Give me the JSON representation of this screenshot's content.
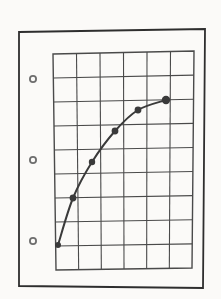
{
  "page": {
    "width": 221,
    "height": 299,
    "background_color": "#f3f2f0",
    "paper_color": "#fbfaf8",
    "ink_color": "#3a3a3a",
    "grid_color": "#4a4a4a",
    "frame_color": "#2e2e2e"
  },
  "frame": {
    "name": "page-border",
    "corners": [
      {
        "x": 19,
        "y": 32
      },
      {
        "x": 205,
        "y": 29
      },
      {
        "x": 203,
        "y": 288
      },
      {
        "x": 19,
        "y": 286
      }
    ],
    "stroke_width": 1.8
  },
  "binder_holes": {
    "label": "three-hole punch marks",
    "radius_outer": 4.0,
    "radius_inner": 2.2,
    "positions": [
      {
        "x": 33,
        "y": 79
      },
      {
        "x": 33,
        "y": 160
      },
      {
        "x": 33,
        "y": 241
      }
    ]
  },
  "grid": {
    "columns": 6,
    "rows": 9,
    "top_left": {
      "x": 53,
      "y": 54
    },
    "top_right": {
      "x": 194,
      "y": 51
    },
    "bottom_right": {
      "x": 192,
      "y": 268
    },
    "bottom_left": {
      "x": 56,
      "y": 270
    },
    "stroke_width": 1.1,
    "border_stroke_width": 1.4
  },
  "chart_data": {
    "type": "line",
    "title": "",
    "subtitle": "",
    "xlabel": "",
    "ylabel": "",
    "grid": true,
    "legend_position": "none",
    "xlim": [
      0,
      6
    ],
    "ylim": [
      0,
      9
    ],
    "x_tick_labels": [],
    "y_tick_labels": [],
    "marker_color": "#3a3a3a",
    "line_color": "#3a3a3a",
    "line_width": 2.0,
    "series": [
      {
        "name": "curve",
        "x": [
          0.18,
          0.78,
          1.56,
          2.48,
          3.42,
          4.55
        ],
        "y": [
          0.95,
          2.92,
          4.43,
          5.72,
          6.62,
          7.08
        ],
        "points_px": [
          {
            "x": 58,
            "y": 245,
            "r": 3.0
          },
          {
            "x": 73,
            "y": 198,
            "r": 3.4
          },
          {
            "x": 92,
            "y": 162,
            "r": 3.2
          },
          {
            "x": 115,
            "y": 131,
            "r": 3.4
          },
          {
            "x": 138,
            "y": 110,
            "r": 3.4
          },
          {
            "x": 166,
            "y": 100,
            "r": 4.2
          }
        ]
      }
    ],
    "shape": "monotonic increasing, concave down (saturating)"
  }
}
